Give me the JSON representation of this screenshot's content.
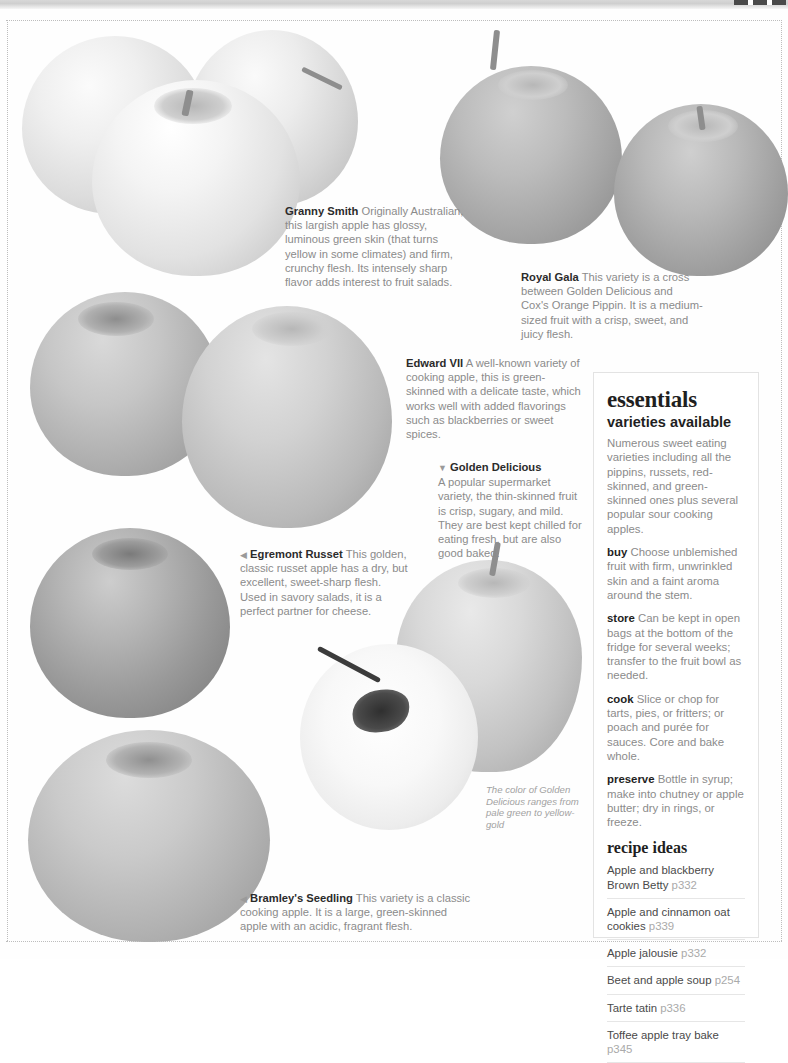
{
  "page": {
    "background_color": "#fefefe",
    "text_color": "#8b8b8b",
    "heading_color": "#1f1f1f"
  },
  "captions": [
    {
      "id": "granny-smith",
      "name": "Granny Smith",
      "marker": "",
      "text": "Originally Australian, this largish apple has glossy, luminous green skin (that turns yellow in some climates) and firm, crunchy flesh. Its intensely sharp flavor adds interest to fruit salads."
    },
    {
      "id": "royal-gala",
      "name": "Royal Gala",
      "marker": "",
      "text": "This variety is a cross between Golden Delicious and Cox's Orange Pippin. It is a medium-sized fruit with a crisp, sweet, and juicy flesh."
    },
    {
      "id": "edward-vii",
      "name": "Edward VII",
      "marker": "",
      "text": "A well-known variety of cooking apple, this is green-skinned with a delicate taste, which works well with added flavorings such as blackberries or sweet spices."
    },
    {
      "id": "golden-delicious",
      "name": "Golden Delicious",
      "marker": "▼",
      "text": "A popular supermarket variety, the thin-skinned fruit is crisp, sugary, and mild. They are best kept chilled for eating fresh, but are also good baked."
    },
    {
      "id": "egremont-russet",
      "name": "Egremont Russet",
      "marker": "◀",
      "text": "This golden, classic russet apple has a dry, but excellent, sweet-sharp flesh. Used in savory salads, it is a perfect partner for cheese."
    },
    {
      "id": "bramleys-seedling",
      "name": "Bramley's Seedling",
      "marker": "◀",
      "text": "This variety is a classic cooking apple. It is a large, green-skinned apple with an acidic, fragrant flesh."
    }
  ],
  "photo_note": "The color of Golden Delicious ranges from pale green to yellow-gold",
  "essentials": {
    "title": "essentials",
    "subtitle": "varieties available",
    "intro": "Numerous sweet eating varieties including all the pippins, russets, red-skinned, and green-skinned ones plus several popular sour cooking apples.",
    "entries": [
      {
        "label": "buy",
        "text": "Choose unblemished fruit with firm, unwrinkled skin and a faint aroma around the stem."
      },
      {
        "label": "store",
        "text": "Can be kept in open bags at the bottom of the fridge for several weeks; transfer to the fruit bowl as needed."
      },
      {
        "label": "cook",
        "text": "Slice or chop for tarts, pies, or fritters; or poach and purée for sauces. Core and bake whole."
      },
      {
        "label": "preserve",
        "text": "Bottle in syrup; make into chutney or apple butter; dry in rings, or freeze."
      }
    ],
    "recipes_title": "recipe ideas",
    "recipes": [
      {
        "name": "Apple and blackberry Brown Betty",
        "page": "p332"
      },
      {
        "name": "Apple and cinnamon oat cookies",
        "page": "p339"
      },
      {
        "name": "Apple jalousie",
        "page": "p332"
      },
      {
        "name": "Beet and apple soup",
        "page": "p254"
      },
      {
        "name": "Tarte tatin",
        "page": "p336"
      },
      {
        "name": "Toffee apple tray bake",
        "page": "p345"
      }
    ]
  }
}
